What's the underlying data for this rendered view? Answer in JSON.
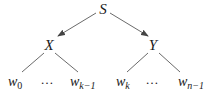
{
  "diagram": {
    "type": "tree",
    "root": {
      "id": "S",
      "label": "S"
    },
    "internal": [
      {
        "id": "X",
        "label": "X"
      },
      {
        "id": "Y",
        "label": "Y"
      }
    ],
    "leaves": [
      {
        "id": "w0",
        "base": "w",
        "sub": "0"
      },
      {
        "id": "dots1",
        "text": "…"
      },
      {
        "id": "wk-1",
        "base": "w",
        "sub": "k−1"
      },
      {
        "id": "wk",
        "base": "w",
        "sub": "k"
      },
      {
        "id": "dots2",
        "text": "…"
      },
      {
        "id": "wn-1",
        "base": "w",
        "sub": "n−1"
      }
    ],
    "edges": [
      {
        "from": "S",
        "to": "X",
        "arrow": true
      },
      {
        "from": "S",
        "to": "Y",
        "arrow": true
      },
      {
        "from": "X",
        "to": "w0",
        "arrow": false
      },
      {
        "from": "X",
        "to": "wk-1",
        "arrow": false
      },
      {
        "from": "Y",
        "to": "wk",
        "arrow": false
      },
      {
        "from": "Y",
        "to": "wn-1",
        "arrow": false
      }
    ]
  }
}
